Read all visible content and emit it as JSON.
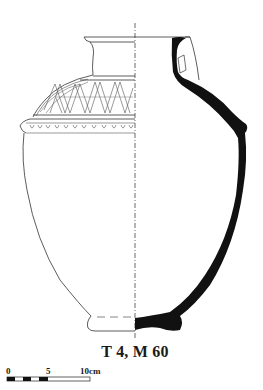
{
  "figure": {
    "label": "T 4, M 60"
  },
  "scale_bar": {
    "ticks": [
      {
        "label": "0"
      },
      {
        "label": "5"
      },
      {
        "label": "10cm"
      }
    ],
    "unit": "cm",
    "length": 10
  },
  "decoration": {
    "shoulder_band": "cross-hatched zigzag triangles",
    "carination_band": "row of impressed loops/ovules"
  },
  "colors": {
    "section_fill": "#111111",
    "line": "#333333",
    "background": "#ffffff"
  }
}
